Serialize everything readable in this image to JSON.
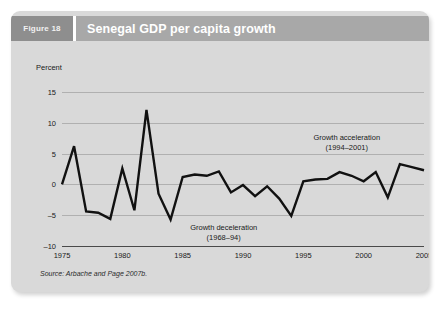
{
  "figure": {
    "number_label": "Figure 18",
    "title": "Senegal GDP per capita growth",
    "source": "Source: Arbache and Page 2007b."
  },
  "annotations": {
    "acceleration": {
      "line1": "Growth acceleration",
      "line2": "(1994–2001)"
    },
    "deceleration": {
      "line1": "Growth deceleration",
      "line2": "(1968–94)"
    }
  },
  "chart_data": {
    "type": "line",
    "title": "Senegal GDP per capita growth",
    "xlabel": "",
    "ylabel": "Percent",
    "ylim": [
      -10,
      15
    ],
    "xlim": [
      1975,
      2005
    ],
    "yticks": [
      15,
      10,
      5,
      0,
      -5,
      -10
    ],
    "xticks": [
      1975,
      1980,
      1985,
      1990,
      1995,
      2000,
      2005
    ],
    "grid": true,
    "legend": "none",
    "series": [
      {
        "name": "GDP per capita growth",
        "color": "#111111",
        "x": [
          1975,
          1976,
          1977,
          1978,
          1979,
          1980,
          1981,
          1982,
          1983,
          1984,
          1985,
          1986,
          1987,
          1988,
          1989,
          1990,
          1991,
          1992,
          1993,
          1994,
          1995,
          1996,
          1997,
          1998,
          1999,
          2000,
          2001,
          2002,
          2003,
          2004,
          2005
        ],
        "values": [
          0.0,
          6.2,
          -4.4,
          -4.6,
          -5.6,
          2.6,
          -4.2,
          12.1,
          -1.5,
          -5.7,
          1.2,
          1.6,
          1.4,
          2.1,
          -1.3,
          -0.1,
          -1.9,
          -0.3,
          -2.3,
          -5.1,
          0.5,
          0.8,
          0.9,
          2.0,
          1.4,
          0.5,
          2.0,
          -2.1,
          3.3,
          2.8,
          2.3
        ]
      }
    ],
    "annotations": [
      {
        "text": "Growth acceleration (1994–2001)",
        "x_range": [
          1994,
          2001
        ]
      },
      {
        "text": "Growth deceleration (1968–94)",
        "x_range": [
          1968,
          1994
        ]
      }
    ]
  }
}
